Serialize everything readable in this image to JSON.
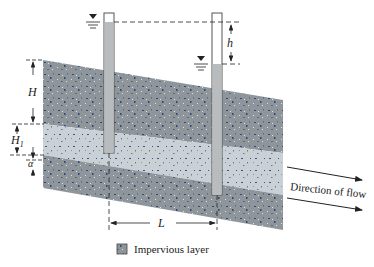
{
  "figure": {
    "labels": {
      "H": "H",
      "H1_main": "H",
      "H1_sub": "1",
      "alpha": "α",
      "h": "h",
      "L": "L",
      "flow": "Direction of flow",
      "legend": "Impervious layer"
    },
    "colors": {
      "impervious": "#8f969b",
      "permeable": "#c9d0d6",
      "tube_fill": "#b9bcbe",
      "tube_border": "#555555",
      "speckle_dark": "#2f4a78",
      "speckle_light": "#5d6a74",
      "line": "#222222"
    }
  }
}
